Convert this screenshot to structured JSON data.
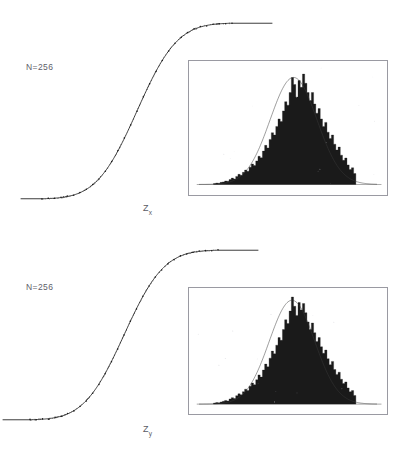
{
  "figure": {
    "background": "#ffffff",
    "ink_color": "#1a1a1a",
    "frame_color": "#9a9aa2",
    "text_color": "#5a5a63"
  },
  "panels": [
    {
      "id": "panel-x",
      "n_label": "N=256",
      "axis_label_base": "Z",
      "axis_label_sub": "x"
    },
    {
      "id": "panel-y",
      "n_label": "N=256",
      "axis_label_base": "Z",
      "axis_label_sub": "y"
    }
  ],
  "caption": {
    "text": ""
  },
  "chart_data": [
    {
      "type": "line",
      "title": "",
      "subtitle": "",
      "xlabel": "Z_x",
      "ylabel": "",
      "annotations": [
        "N=256"
      ],
      "grid": false,
      "legend": null,
      "series": [
        {
          "name": "empirical cumulative distribution (data points)",
          "style": "dotted-points-on-curve",
          "x": [
            -3.0,
            -2.8,
            -2.6,
            -2.4,
            -2.2,
            -2.0,
            -1.8,
            -1.6,
            -1.4,
            -1.2,
            -1.0,
            -0.8,
            -0.6,
            -0.4,
            -0.2,
            0.0,
            0.2,
            0.4,
            0.6,
            0.8,
            1.0,
            1.2,
            1.4,
            1.6,
            1.8,
            2.0,
            2.2,
            2.4,
            2.6,
            2.8,
            3.0
          ],
          "y": [
            0.001,
            0.003,
            0.005,
            0.008,
            0.014,
            0.023,
            0.036,
            0.055,
            0.081,
            0.115,
            0.159,
            0.212,
            0.274,
            0.345,
            0.421,
            0.5,
            0.579,
            0.655,
            0.726,
            0.788,
            0.841,
            0.885,
            0.919,
            0.945,
            0.964,
            0.977,
            0.986,
            0.992,
            0.995,
            0.997,
            0.999
          ]
        },
        {
          "name": "fitted normal cumulative distribution",
          "style": "smooth-line",
          "x": [
            -3.0,
            -2.5,
            -2.0,
            -1.5,
            -1.0,
            -0.5,
            0.0,
            0.5,
            1.0,
            1.5,
            2.0,
            2.5,
            3.0
          ],
          "y": [
            0.001,
            0.006,
            0.023,
            0.067,
            0.159,
            0.309,
            0.5,
            0.691,
            0.841,
            0.933,
            0.977,
            0.994,
            0.999
          ]
        }
      ],
      "xlim": [
        -3.0,
        3.0
      ],
      "ylim": [
        0.0,
        1.0
      ],
      "inset": {
        "type": "bar",
        "description": "histogram of Z_x with overlaid fitted normal density",
        "xlim": [
          -4.0,
          4.0
        ],
        "ylim": [
          0,
          1.0
        ],
        "bin_centers": [
          -3.3,
          -3.2,
          -3.1,
          -3.0,
          -2.9,
          -2.8,
          -2.7,
          -2.6,
          -2.5,
          -2.4,
          -2.3,
          -2.2,
          -2.1,
          -2.0,
          -1.9,
          -1.8,
          -1.7,
          -1.6,
          -1.5,
          -1.4,
          -1.3,
          -1.2,
          -1.1,
          -1.0,
          -0.9,
          -0.8,
          -0.7,
          -0.6,
          -0.5,
          -0.4,
          -0.3,
          -0.2,
          -0.1,
          0.0,
          0.1,
          0.2,
          0.3,
          0.4,
          0.5,
          0.6,
          0.7,
          0.8,
          0.9,
          1.0,
          1.1,
          1.2,
          1.3,
          1.4,
          1.5,
          1.6,
          1.7,
          1.8,
          1.9,
          2.0,
          2.1,
          2.2,
          2.3,
          2.4,
          2.5,
          2.6,
          2.7,
          2.8,
          2.9,
          3.0
        ],
        "values": [
          0.008,
          0.012,
          0.01,
          0.018,
          0.022,
          0.03,
          0.028,
          0.042,
          0.055,
          0.048,
          0.07,
          0.088,
          0.08,
          0.105,
          0.125,
          0.115,
          0.15,
          0.178,
          0.165,
          0.205,
          0.245,
          0.232,
          0.29,
          0.34,
          0.318,
          0.392,
          0.45,
          0.43,
          0.505,
          0.57,
          0.548,
          0.64,
          0.72,
          0.69,
          0.8,
          0.93,
          0.87,
          0.76,
          0.905,
          0.845,
          0.96,
          0.88,
          0.8,
          0.73,
          0.8,
          0.7,
          0.62,
          0.66,
          0.57,
          0.505,
          0.54,
          0.455,
          0.4,
          0.43,
          0.35,
          0.3,
          0.325,
          0.255,
          0.21,
          0.23,
          0.17,
          0.13,
          0.145,
          0.095
        ],
        "overlay_curve": {
          "name": "fitted normal density",
          "mean": 0.25,
          "sigma": 1.05
        }
      }
    },
    {
      "type": "line",
      "title": "",
      "subtitle": "",
      "xlabel": "Z_y",
      "ylabel": "",
      "annotations": [
        "N=256"
      ],
      "grid": false,
      "legend": null,
      "series": [
        {
          "name": "empirical cumulative distribution (data points)",
          "style": "dotted-points-on-curve",
          "x": [
            -3.0,
            -2.8,
            -2.6,
            -2.4,
            -2.2,
            -2.0,
            -1.8,
            -1.6,
            -1.4,
            -1.2,
            -1.0,
            -0.8,
            -0.6,
            -0.4,
            -0.2,
            0.0,
            0.2,
            0.4,
            0.6,
            0.8,
            1.0,
            1.2,
            1.4,
            1.6,
            1.8,
            2.0,
            2.2,
            2.4,
            2.6,
            2.8,
            3.0
          ],
          "y": [
            0.001,
            0.003,
            0.005,
            0.008,
            0.014,
            0.023,
            0.036,
            0.055,
            0.081,
            0.115,
            0.159,
            0.212,
            0.274,
            0.345,
            0.421,
            0.5,
            0.579,
            0.655,
            0.726,
            0.788,
            0.841,
            0.885,
            0.919,
            0.945,
            0.964,
            0.977,
            0.986,
            0.992,
            0.995,
            0.997,
            0.999
          ]
        },
        {
          "name": "fitted normal cumulative distribution",
          "style": "smooth-line",
          "x": [
            -3.0,
            -2.5,
            -2.0,
            -1.5,
            -1.0,
            -0.5,
            0.0,
            0.5,
            1.0,
            1.5,
            2.0,
            2.5,
            3.0
          ],
          "y": [
            0.001,
            0.006,
            0.023,
            0.067,
            0.159,
            0.309,
            0.5,
            0.691,
            0.841,
            0.933,
            0.977,
            0.994,
            0.999
          ]
        }
      ],
      "xlim": [
        -3.0,
        3.0
      ],
      "ylim": [
        0.0,
        1.0
      ],
      "inset": {
        "type": "bar",
        "description": "histogram of Z_y with overlaid fitted normal density",
        "xlim": [
          -4.0,
          4.0
        ],
        "ylim": [
          0,
          1.0
        ],
        "bin_centers": [
          -3.3,
          -3.2,
          -3.1,
          -3.0,
          -2.9,
          -2.8,
          -2.7,
          -2.6,
          -2.5,
          -2.4,
          -2.3,
          -2.2,
          -2.1,
          -2.0,
          -1.9,
          -1.8,
          -1.7,
          -1.6,
          -1.5,
          -1.4,
          -1.3,
          -1.2,
          -1.1,
          -1.0,
          -0.9,
          -0.8,
          -0.7,
          -0.6,
          -0.5,
          -0.4,
          -0.3,
          -0.2,
          -0.1,
          0.0,
          0.1,
          0.2,
          0.3,
          0.4,
          0.5,
          0.6,
          0.7,
          0.8,
          0.9,
          1.0,
          1.1,
          1.2,
          1.3,
          1.4,
          1.5,
          1.6,
          1.7,
          1.8,
          1.9,
          2.0,
          2.1,
          2.2,
          2.3,
          2.4,
          2.5,
          2.6,
          2.7,
          2.8,
          2.9,
          3.0
        ],
        "values": [
          0.01,
          0.014,
          0.012,
          0.02,
          0.026,
          0.034,
          0.03,
          0.048,
          0.06,
          0.052,
          0.078,
          0.095,
          0.086,
          0.115,
          0.138,
          0.126,
          0.165,
          0.195,
          0.18,
          0.225,
          0.27,
          0.25,
          0.315,
          0.37,
          0.345,
          0.425,
          0.49,
          0.465,
          0.545,
          0.615,
          0.59,
          0.69,
          0.78,
          0.745,
          0.86,
          0.99,
          0.905,
          0.82,
          0.94,
          0.87,
          0.93,
          0.845,
          0.76,
          0.69,
          0.75,
          0.66,
          0.58,
          0.615,
          0.53,
          0.47,
          0.5,
          0.42,
          0.365,
          0.395,
          0.32,
          0.275,
          0.295,
          0.23,
          0.19,
          0.205,
          0.15,
          0.115,
          0.125,
          0.08
        ],
        "overlay_curve": {
          "name": "fitted normal density",
          "mean": 0.18,
          "sigma": 1.02
        }
      }
    }
  ]
}
